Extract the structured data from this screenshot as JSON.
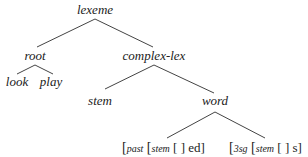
{
  "diagram": {
    "type": "tree",
    "nodes": {
      "lexeme": "lexeme",
      "root": "root",
      "complex_lex": "complex-lex",
      "look": "look",
      "play": "play",
      "stem": "stem",
      "word": "word"
    },
    "leaves": {
      "past": {
        "open1": "[",
        "label": "past",
        "open2": " [",
        "inner": "stem",
        "rest": " [ ] ed]"
      },
      "sg3": {
        "open1": "[",
        "label": "3sg",
        "open2": " [",
        "inner": "stem",
        "rest": " [ ] s]"
      }
    },
    "edges": [
      [
        "lexeme",
        "root"
      ],
      [
        "lexeme",
        "complex-lex"
      ],
      [
        "root",
        "look"
      ],
      [
        "root",
        "play"
      ],
      [
        "complex-lex",
        "stem"
      ],
      [
        "complex-lex",
        "word"
      ],
      [
        "word",
        "past"
      ],
      [
        "word",
        "3sg"
      ]
    ]
  }
}
